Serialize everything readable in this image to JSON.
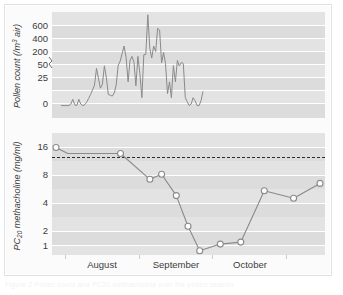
{
  "figure": {
    "background": "#ffffff",
    "panel_background": "#dcdcdc",
    "band_color": "#e6e6e6",
    "gridline_color": "#ffffff",
    "series_color": "#8a8a8a",
    "marker_fill": "#ffffff",
    "marker_stroke": "#8a8a8a",
    "threshold_color": "#2b2b2b",
    "frame_color": "#e2e2e2",
    "caption_faint": "Figure 2  Pollen count and PC20 methacholine over the pollen season"
  },
  "chart_data": [
    {
      "type": "line",
      "id": "pollen-count-panel",
      "title": "",
      "xlabel": "",
      "ylabel": "Pollen count (/m3 air)",
      "ylabel_parts": {
        "pre": "Pollen count (/m",
        "sup": "3",
        "post": " air)"
      },
      "ylim": [
        0,
        700
      ],
      "yticks": [
        0,
        25,
        50,
        200,
        400,
        600
      ],
      "ytick_labels": [
        "0",
        "25",
        "50",
        "200",
        "400",
        "600"
      ],
      "axis_break": true,
      "axis_break_between": [
        50,
        200
      ],
      "grid": true,
      "legend": "none",
      "xlim": [
        "August",
        "October"
      ],
      "x": [
        0,
        1,
        2,
        3,
        4,
        5,
        6,
        7,
        8,
        9,
        10,
        11,
        12,
        13,
        14,
        15,
        16,
        17,
        18,
        19,
        20,
        21,
        22,
        23,
        24,
        25,
        26,
        27,
        28,
        29,
        30,
        31,
        32,
        33,
        34,
        35,
        36,
        37,
        38,
        39,
        40,
        41,
        42,
        43,
        44,
        45,
        46,
        47,
        48,
        49,
        50,
        51,
        52,
        53,
        54,
        55,
        56,
        57,
        58,
        59,
        60,
        61,
        62,
        63,
        64,
        65,
        66,
        67,
        68,
        69,
        70,
        71,
        72
      ],
      "values": [
        0,
        0,
        0,
        0,
        0,
        2,
        8,
        1,
        0,
        8,
        2,
        0,
        1,
        4,
        9,
        14,
        20,
        26,
        47,
        34,
        22,
        27,
        52,
        35,
        14,
        13,
        12,
        16,
        26,
        60,
        110,
        205,
        300,
        155,
        30,
        120,
        170,
        95,
        25,
        170,
        40,
        10,
        190,
        195,
        690,
        270,
        150,
        300,
        230,
        520,
        500,
        90,
        220,
        80,
        15,
        30,
        10,
        55,
        30,
        120,
        50,
        95,
        80,
        10,
        5,
        0,
        2,
        10,
        6,
        0,
        0,
        6,
        18
      ]
    },
    {
      "type": "line",
      "id": "pc20-methacholine-panel",
      "title": "",
      "xlabel": "",
      "ylabel": "PC20 methacholine (mg/ml)",
      "ylabel_parts": {
        "pre": "PC",
        "sub": "20",
        "post": " methacholine (mg/ml)"
      },
      "yscale": "log",
      "ylim": [
        0.75,
        20
      ],
      "yticks": [
        1,
        2,
        4,
        8,
        16
      ],
      "ytick_labels": [
        "1",
        "2",
        "4",
        "8",
        "16"
      ],
      "grid": true,
      "legend": "none",
      "markers": "open-circle",
      "threshold": {
        "value": 12,
        "style": "dashed",
        "label": ""
      },
      "x": [
        1,
        5,
        23,
        33,
        37,
        42,
        46,
        50,
        57,
        64,
        72,
        82,
        91
      ],
      "values": [
        16.0,
        13.5,
        13.5,
        6.5,
        7.5,
        4.1,
        1.72,
        0.86,
        1.04,
        1.1,
        4.7,
        3.8,
        5.8
      ]
    }
  ],
  "xaxis": {
    "ticks": [
      "",
      "",
      "",
      ""
    ],
    "month_labels": [
      "August",
      "September",
      "October"
    ]
  }
}
